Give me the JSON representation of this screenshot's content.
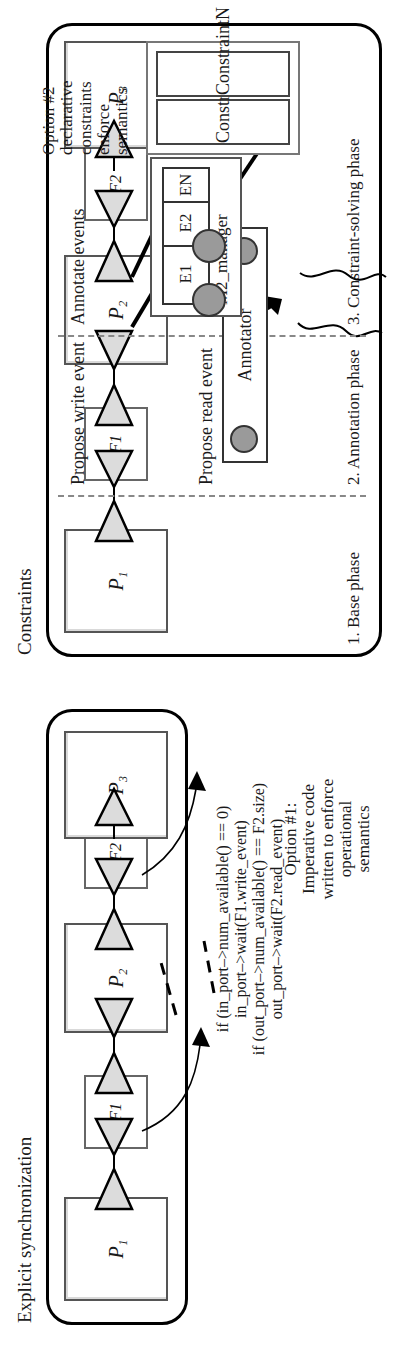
{
  "figure": {
    "orientation": "rotated-90-ccw",
    "panels": [
      {
        "id": "explicit-synchronization",
        "title": "Explicit synchronization"
      },
      {
        "id": "constraints",
        "title": "Constraints"
      }
    ]
  },
  "explicit": {
    "title": "Explicit synchronization",
    "processes": [
      {
        "label": "P₁",
        "name": "P1"
      },
      {
        "label": "P₂",
        "name": "P2"
      },
      {
        "label": "P₃",
        "name": "P3"
      }
    ],
    "fifos": [
      {
        "label": "F1"
      },
      {
        "label": "F2"
      }
    ],
    "note": {
      "line1": "Option #1:",
      "line2": "Imperative code",
      "line3": "written to enforce",
      "line4": "operational",
      "line5": "semantics"
    },
    "code": {
      "line1": "if (in_port–>num_available() == 0)",
      "line2": "in_port–>wait(F1.write_event)",
      "line3": "if (out_port–>num_available() == F2.size)",
      "line4": "out_port–>wait(F2.read_event)"
    }
  },
  "constraints": {
    "title": "Constraints",
    "processes": [
      {
        "label": "P₁",
        "name": "P1"
      },
      {
        "label": "P₂",
        "name": "P2"
      },
      {
        "label": "P₃",
        "name": "P3"
      }
    ],
    "fifos": [
      {
        "label": "F1"
      },
      {
        "label": "F2"
      }
    ],
    "phases": [
      {
        "label": "1. Base phase"
      },
      {
        "label": "2. Annotation phase"
      },
      {
        "label": "3. Constraint-solving phase"
      }
    ],
    "events": [
      {
        "label": "Propose read event"
      },
      {
        "label": "Propose write event"
      },
      {
        "label": "Annotate events"
      }
    ],
    "annotator": {
      "label": "Annotator"
    },
    "manager": {
      "label": "M2_manager",
      "cells": [
        "E1",
        "E2",
        "EN"
      ]
    },
    "constraint_boxes": [
      {
        "label": "Constraint1"
      },
      {
        "label": "ConstraintN"
      }
    ],
    "note": {
      "line1": "Option #2",
      "line2": "declarative",
      "line3": "constraints",
      "line4": "enforce",
      "line5": "semantics"
    }
  },
  "colors": {
    "outline": "#000000",
    "box_border": "#555555",
    "triangle_fill": "#d9d9d9",
    "dot_fill": "#9a9a9a",
    "dashed_divider": "#888888",
    "background": "#ffffff"
  }
}
